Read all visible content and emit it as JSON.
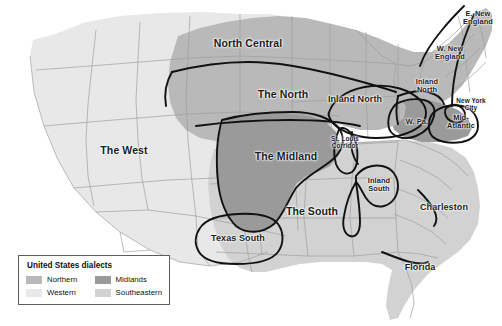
{
  "map": {
    "title": "United States dialects map",
    "background_color": "#ffffff",
    "colors": {
      "northern": "#b9b9b9",
      "western": "#e8e8e8",
      "midlands": "#9a9a9a",
      "southeastern": "#d2d2d2",
      "state_border": "#9d9d9d",
      "dialect_boundary": "#111111",
      "text": "#1b1b1b"
    },
    "labels": [
      {
        "id": "north-central",
        "text": "North Central",
        "x": 248,
        "y": 44,
        "size": "sz-lg"
      },
      {
        "id": "the-north",
        "text": "The North",
        "x": 283,
        "y": 95,
        "size": "sz-lg"
      },
      {
        "id": "inland-north",
        "text": "Inland North",
        "x": 355,
        "y": 100,
        "size": "sz-md"
      },
      {
        "id": "the-west",
        "text": "The West",
        "x": 124,
        "y": 151,
        "size": "sz-lg"
      },
      {
        "id": "the-midland",
        "text": "The Midland",
        "x": 286,
        "y": 157,
        "size": "sz-lg"
      },
      {
        "id": "st-louis-corridor",
        "text": "St. Louis\nCorridor",
        "x": 345,
        "y": 143,
        "size": "sz-xs"
      },
      {
        "id": "the-south",
        "text": "The South",
        "x": 312,
        "y": 212,
        "size": "sz-lg"
      },
      {
        "id": "texas-south",
        "text": "Texas South",
        "x": 238,
        "y": 239,
        "size": "sz-md"
      },
      {
        "id": "inland-south",
        "text": "Inland\nSouth",
        "x": 379,
        "y": 185,
        "size": "sz-sm"
      },
      {
        "id": "charleston",
        "text": "Charleston",
        "x": 444,
        "y": 208,
        "size": "sz-md"
      },
      {
        "id": "florida",
        "text": "Florida",
        "x": 420,
        "y": 268,
        "size": "sz-md"
      },
      {
        "id": "e-new-england",
        "text": "E. New\nEngland",
        "x": 478,
        "y": 18,
        "size": "sz-sm"
      },
      {
        "id": "w-new-england",
        "text": "W. New\nEngland",
        "x": 450,
        "y": 53,
        "size": "sz-sm"
      },
      {
        "id": "inland-north-ne",
        "text": "Inland\nNorth",
        "x": 427,
        "y": 86,
        "size": "sz-sm"
      },
      {
        "id": "new-york-city",
        "text": "New York\nCity",
        "x": 471,
        "y": 105,
        "size": "sz-xs"
      },
      {
        "id": "w-pa",
        "text": "W. Pa.",
        "x": 417,
        "y": 122,
        "size": "sz-sm"
      },
      {
        "id": "mid-atlantic",
        "text": "Mid-Atlantic",
        "x": 461,
        "y": 122,
        "size": "sz-sm"
      }
    ]
  },
  "legend": {
    "title": "United States dialects",
    "items": [
      {
        "label": "Northern",
        "color": "#b9b9b9"
      },
      {
        "label": "Midlands",
        "color": "#9a9a9a"
      },
      {
        "label": "Western",
        "color": "#e8e8e8"
      },
      {
        "label": "Southeastern",
        "color": "#d2d2d2"
      }
    ]
  }
}
